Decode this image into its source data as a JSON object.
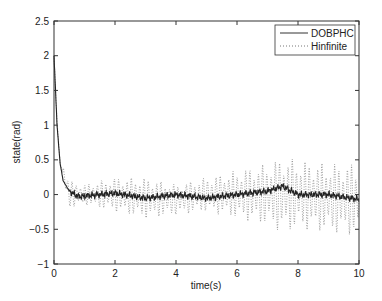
{
  "chart_data": {
    "type": "line",
    "title": "",
    "xlabel": "time(s)",
    "ylabel": "state(rad)",
    "xlim": [
      0,
      10
    ],
    "ylim": [
      -1,
      2.5
    ],
    "xticks": [
      "0",
      "2",
      "4",
      "6",
      "8",
      "10"
    ],
    "yticks": [
      "-1",
      "-0.5",
      "0",
      "0.5",
      "1",
      "1.5",
      "2",
      "2.5"
    ],
    "grid": false,
    "legend_position": "upper right",
    "series": [
      {
        "name": "DOBPHC",
        "style": "solid",
        "x": [
          0,
          0.1,
          0.2,
          0.3,
          0.5,
          0.8,
          1,
          2,
          3,
          4,
          5,
          6,
          7,
          7.5,
          8,
          9,
          10
        ],
        "values": [
          2.0,
          1.0,
          0.45,
          0.2,
          0.05,
          -0.03,
          -0.02,
          0.02,
          -0.05,
          0.0,
          -0.05,
          0.0,
          0.05,
          0.12,
          0.0,
          0.0,
          -0.07
        ]
      },
      {
        "name": "Hinfinite",
        "style": "dotted",
        "x": [
          0,
          0.1,
          0.2,
          0.5,
          1,
          2,
          3,
          4,
          5,
          6,
          7,
          7.5,
          8,
          9,
          10
        ],
        "envelope_upper": [
          2.0,
          1.2,
          0.6,
          0.2,
          0.15,
          0.25,
          0.25,
          0.15,
          0.25,
          0.35,
          0.45,
          0.55,
          0.5,
          0.45,
          0.45
        ],
        "envelope_lower": [
          2.0,
          0.9,
          0.3,
          -0.2,
          -0.15,
          -0.25,
          -0.35,
          -0.3,
          -0.25,
          -0.35,
          -0.45,
          -0.55,
          -0.5,
          -0.55,
          -0.6
        ]
      }
    ]
  }
}
